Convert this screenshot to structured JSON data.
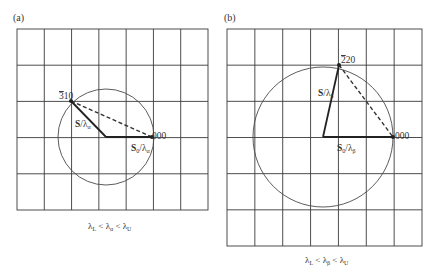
{
  "panels": [
    {
      "id": "a",
      "label": "(a)",
      "grid": {
        "x0": 17,
        "y0": 29,
        "x1": 208,
        "y1": 210,
        "cols": 7,
        "rows": 5
      },
      "circle": {
        "cx": 106,
        "cy": 137,
        "r": 48
      },
      "origin": {
        "x": 152,
        "y": 137,
        "label": "000"
      },
      "point": {
        "x": 71,
        "y": 101,
        "label": "3̄10",
        "label_bar": "3",
        "label_rest": "10"
      },
      "vector_incident": {
        "label_main": "S",
        "label_sub": "0",
        "label_lambda": "λ",
        "label_lambda_sub": "α"
      },
      "vector_scattered": {
        "label_main": "S",
        "label_lambda": "λ",
        "label_lambda_sub": "α"
      },
      "caption": {
        "l1": "λ",
        "s1": "L",
        "op1": " < ",
        "l2": "λ",
        "s2": "α",
        "op2": " < ",
        "l3": "λ",
        "s3": "U"
      }
    },
    {
      "id": "b",
      "label": "(b)",
      "grid": {
        "x0": 227,
        "y0": 29,
        "x1": 422,
        "y1": 246,
        "cols": 7,
        "rows": 6
      },
      "circle": {
        "cx": 323,
        "cy": 137,
        "r": 70
      },
      "origin": {
        "x": 393,
        "y": 137,
        "label": "000"
      },
      "point": {
        "x": 339,
        "y": 65,
        "label": "2̄20",
        "label_bar": "2",
        "label_rest": "20"
      },
      "vector_incident": {
        "label_main": "S",
        "label_sub": "0",
        "label_lambda": "λ",
        "label_lambda_sub": "β"
      },
      "vector_scattered": {
        "label_main": "S",
        "label_lambda": "λ",
        "label_lambda_sub": "β"
      },
      "caption": {
        "l1": "λ",
        "s1": "L",
        "op1": " < ",
        "l2": "λ",
        "s2": "β",
        "op2": " < ",
        "l3": "λ",
        "s3": "U"
      }
    }
  ]
}
